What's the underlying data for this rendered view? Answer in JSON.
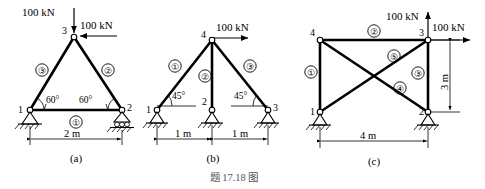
{
  "figure": {
    "caption": "题 17.18 图",
    "subfigures": [
      {
        "id": "a",
        "label": "(a)",
        "description": "Equilateral triangular truss, pin support at node 1, roller support at node 2, loads at apex node 3",
        "nodes": [
          {
            "id": "1",
            "label": "1",
            "support": "pin"
          },
          {
            "id": "2",
            "label": "2",
            "support": "roller"
          },
          {
            "id": "3",
            "label": "3",
            "support": "none"
          }
        ],
        "members": [
          {
            "id": "1",
            "label": "①",
            "from": "1",
            "to": "2"
          },
          {
            "id": "2",
            "label": "②",
            "from": "3",
            "to": "2"
          },
          {
            "id": "3",
            "label": "③",
            "from": "1",
            "to": "3"
          }
        ],
        "loads": [
          {
            "label": "100 kN",
            "value": 100,
            "unit": "kN",
            "direction": "down",
            "at_node": "3"
          },
          {
            "label": "100 kN",
            "value": 100,
            "unit": "kN",
            "direction": "right",
            "at_node": "3"
          }
        ],
        "angles": [
          {
            "label": "60°",
            "at_node": "1"
          },
          {
            "label": "60°",
            "at_node": "2"
          }
        ],
        "dimensions": [
          {
            "label": "2 m",
            "value": 2,
            "unit": "m",
            "orientation": "horizontal"
          }
        ]
      },
      {
        "id": "b",
        "label": "(b)",
        "description": "Triangular truss with central vertical member, three pin supports at nodes 1, 2, 3, horizontal load at apex node 4",
        "nodes": [
          {
            "id": "1",
            "label": "1",
            "support": "pin"
          },
          {
            "id": "2",
            "label": "2",
            "support": "pin"
          },
          {
            "id": "3",
            "label": "3",
            "support": "pin"
          },
          {
            "id": "4",
            "label": "4",
            "support": "none"
          }
        ],
        "members": [
          {
            "id": "1",
            "label": "①",
            "from": "1",
            "to": "4"
          },
          {
            "id": "2",
            "label": "②",
            "from": "2",
            "to": "4"
          },
          {
            "id": "3",
            "label": "③",
            "from": "4",
            "to": "3"
          }
        ],
        "loads": [
          {
            "label": "100 kN",
            "value": 100,
            "unit": "kN",
            "direction": "right",
            "at_node": "4"
          }
        ],
        "angles": [
          {
            "label": "45°",
            "at_node": "1"
          },
          {
            "label": "45°",
            "at_node": "3"
          }
        ],
        "dimensions": [
          {
            "label": "1 m",
            "value": 1,
            "unit": "m",
            "orientation": "horizontal"
          },
          {
            "label": "1 m",
            "value": 1,
            "unit": "m",
            "orientation": "horizontal"
          }
        ]
      },
      {
        "id": "c",
        "label": "(c)",
        "description": "Rectangular cross-braced truss, pin supports at nodes 1 and 2, vertical and horizontal loads at node 3",
        "nodes": [
          {
            "id": "1",
            "label": "1",
            "support": "pin"
          },
          {
            "id": "2",
            "label": "2",
            "support": "pin"
          },
          {
            "id": "3",
            "label": "3",
            "support": "none"
          },
          {
            "id": "4",
            "label": "4",
            "support": "none"
          }
        ],
        "members": [
          {
            "id": "1",
            "label": "①",
            "from": "1",
            "to": "4"
          },
          {
            "id": "2",
            "label": "②",
            "from": "4",
            "to": "3"
          },
          {
            "id": "3",
            "label": "③",
            "from": "3",
            "to": "2"
          },
          {
            "id": "4",
            "label": "④",
            "from": "4",
            "to": "2"
          },
          {
            "id": "5",
            "label": "⑤",
            "from": "1",
            "to": "3"
          }
        ],
        "loads": [
          {
            "label": "100 kN",
            "value": 100,
            "unit": "kN",
            "direction": "up",
            "at_node": "3"
          },
          {
            "label": "100 kN",
            "value": 100,
            "unit": "kN",
            "direction": "right",
            "at_node": "3"
          }
        ],
        "angles": [],
        "dimensions": [
          {
            "label": "4 m",
            "value": 4,
            "unit": "m",
            "orientation": "horizontal"
          },
          {
            "label": "3 m",
            "value": 3,
            "unit": "m",
            "orientation": "vertical"
          }
        ]
      }
    ]
  }
}
